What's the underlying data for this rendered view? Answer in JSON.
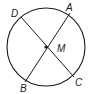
{
  "diagram": {
    "type": "circle-with-diameters",
    "center": {
      "label": "M",
      "x": 46,
      "y": 47
    },
    "radius": 39,
    "points": [
      {
        "label": "A",
        "x": 70,
        "y": 13,
        "label_x": 66,
        "label_y": 11
      },
      {
        "label": "D",
        "x": 21,
        "y": 17,
        "label_x": 11,
        "label_y": 17
      },
      {
        "label": "B",
        "x": 25,
        "y": 82,
        "label_x": 20,
        "label_y": 92
      },
      {
        "label": "C",
        "x": 74,
        "y": 77,
        "label_x": 75,
        "label_y": 86
      }
    ],
    "segments": [
      {
        "from": "A",
        "to": "B"
      },
      {
        "from": "D",
        "to": "C"
      }
    ],
    "center_label_pos": {
      "x": 57,
      "y": 52
    },
    "stroke_color": "#1a1a1a"
  }
}
